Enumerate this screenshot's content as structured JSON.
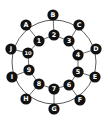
{
  "diagram": {
    "type": "graph",
    "colors": {
      "edge": "#5a5a5a",
      "node_fill": "#111111",
      "node_text": "#ffffff",
      "background": "#ffffff"
    },
    "outer_ring": {
      "cx": 54,
      "cy": 62,
      "r": 42
    },
    "nodes": [
      {
        "id": "B",
        "label": "B",
        "x": 53,
        "y": 15,
        "ring": "outer"
      },
      {
        "id": "C",
        "label": "C",
        "x": 79,
        "y": 25,
        "ring": "outer"
      },
      {
        "id": "D",
        "label": "D",
        "x": 96,
        "y": 49,
        "ring": "outer"
      },
      {
        "id": "E",
        "label": "E",
        "x": 95,
        "y": 77,
        "ring": "outer"
      },
      {
        "id": "F",
        "label": "F",
        "x": 80,
        "y": 100,
        "ring": "outer"
      },
      {
        "id": "G",
        "label": "G",
        "x": 54,
        "y": 109,
        "ring": "outer"
      },
      {
        "id": "H",
        "label": "H",
        "x": 26,
        "y": 99,
        "ring": "outer"
      },
      {
        "id": "I",
        "label": "I",
        "x": 12,
        "y": 77,
        "ring": "outer"
      },
      {
        "id": "J",
        "label": "J",
        "x": 11,
        "y": 49,
        "ring": "outer"
      },
      {
        "id": "A",
        "label": "A",
        "x": 26,
        "y": 25,
        "ring": "outer"
      },
      {
        "id": "2",
        "label": "2",
        "x": 54,
        "y": 35,
        "ring": "inner"
      },
      {
        "id": "3",
        "label": "3",
        "x": 69,
        "y": 41,
        "ring": "inner"
      },
      {
        "id": "4",
        "label": "4",
        "x": 78,
        "y": 55,
        "ring": "inner"
      },
      {
        "id": "5",
        "label": "5",
        "x": 78,
        "y": 72,
        "ring": "inner"
      },
      {
        "id": "6",
        "label": "6",
        "x": 69,
        "y": 85,
        "ring": "inner"
      },
      {
        "id": "7",
        "label": "7",
        "x": 54,
        "y": 89,
        "ring": "inner"
      },
      {
        "id": "8",
        "label": "8",
        "x": 39,
        "y": 84,
        "ring": "inner"
      },
      {
        "id": "9",
        "label": "9",
        "x": 29,
        "y": 70,
        "ring": "inner"
      },
      {
        "id": "10",
        "label": "10",
        "x": 28,
        "y": 53,
        "ring": "inner"
      },
      {
        "id": "1",
        "label": "1",
        "x": 39,
        "y": 41,
        "ring": "inner"
      }
    ],
    "edges": [
      [
        "1",
        "2"
      ],
      [
        "2",
        "3"
      ],
      [
        "3",
        "4"
      ],
      [
        "4",
        "5"
      ],
      [
        "5",
        "6"
      ],
      [
        "6",
        "7"
      ],
      [
        "7",
        "8"
      ],
      [
        "8",
        "9"
      ],
      [
        "9",
        "10"
      ],
      [
        "10",
        "1"
      ],
      [
        "B",
        "2"
      ],
      [
        "C",
        "3"
      ],
      [
        "D",
        "4"
      ],
      [
        "E",
        "5"
      ],
      [
        "F",
        "6"
      ],
      [
        "G",
        "7"
      ],
      [
        "H",
        "8"
      ],
      [
        "I",
        "9"
      ],
      [
        "J",
        "10"
      ],
      [
        "A",
        "1"
      ]
    ]
  }
}
